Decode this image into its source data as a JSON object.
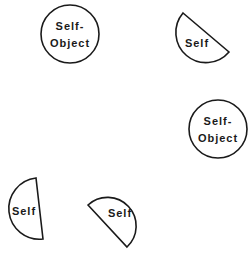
{
  "diagram": {
    "nodes": [
      {
        "id": "self-object-1",
        "shape": "circle",
        "lines": [
          "Self-",
          "Object"
        ]
      },
      {
        "id": "self-1",
        "shape": "half-circle",
        "lines": [
          "Self"
        ]
      },
      {
        "id": "self-object-2",
        "shape": "circle",
        "lines": [
          "Self-",
          "Object"
        ]
      },
      {
        "id": "self-2",
        "shape": "half-circle",
        "lines": [
          "Self"
        ]
      },
      {
        "id": "self-3",
        "shape": "half-circle",
        "lines": [
          "Self"
        ]
      }
    ],
    "colors": {
      "stroke": "#1a1a1a",
      "fill": "#ffffff"
    }
  }
}
